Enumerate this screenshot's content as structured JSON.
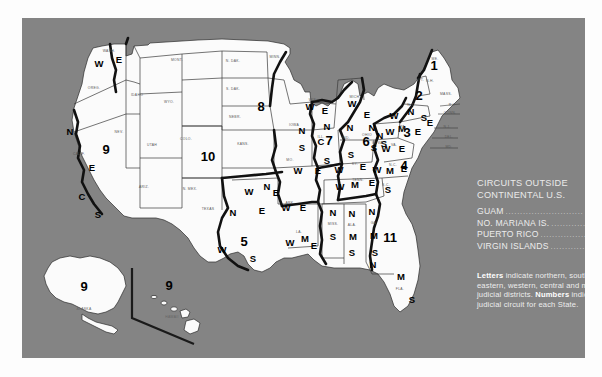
{
  "panel": {
    "background_color": "#848484",
    "land_color": "#fbfbfb",
    "boundary_color": "#111111"
  },
  "legend": {
    "title_line1": "CIRCUITS OUTSIDE",
    "title_line2": "CONTINENTAL U.S.",
    "dots": "...........................",
    "entries": [
      {
        "name": "GUAM",
        "value": "9"
      },
      {
        "name": "NO. MARIANA IS.",
        "value": "9"
      },
      {
        "name": "PUERTO RICO",
        "value": "1"
      },
      {
        "name": "VIRGIN ISLANDS",
        "value": "3"
      }
    ]
  },
  "notes": {
    "letters_label": "Letters",
    "letters_text": " indicate northern, southern, eastern, western, central and middle judicial districts.",
    "numbers_label": "Numbers",
    "numbers_text": " indicate judicial circuit for each State."
  },
  "insets": {
    "alaska": {
      "abbr": "ALASKA",
      "circuit": "9"
    },
    "hawaii": {
      "abbr": "HAWAII",
      "circuit": "9"
    }
  },
  "circuit_numbers": [
    {
      "id": "c1",
      "label": "1",
      "x": 412,
      "y": 52
    },
    {
      "id": "c2",
      "label": "2",
      "x": 397,
      "y": 82
    },
    {
      "id": "c3",
      "label": "3",
      "x": 385,
      "y": 119
    },
    {
      "id": "c4",
      "label": "4",
      "x": 382,
      "y": 152
    },
    {
      "id": "c5",
      "label": "5",
      "x": 222,
      "y": 228
    },
    {
      "id": "c6",
      "label": "6",
      "x": 344,
      "y": 128
    },
    {
      "id": "c7",
      "label": "7",
      "x": 307,
      "y": 127
    },
    {
      "id": "c8",
      "label": "8",
      "x": 239,
      "y": 93
    },
    {
      "id": "c9",
      "label": "9",
      "x": 84,
      "y": 136
    },
    {
      "id": "c10",
      "label": "10",
      "x": 186,
      "y": 143
    },
    {
      "id": "c11",
      "label": "11",
      "x": 368,
      "y": 224
    }
  ],
  "district_letters": [
    {
      "state": "washington",
      "label": "W",
      "x": 77,
      "y": 49
    },
    {
      "state": "washington",
      "label": "E",
      "x": 97,
      "y": 45
    },
    {
      "state": "california",
      "label": "N",
      "x": 48,
      "y": 117
    },
    {
      "state": "california",
      "label": "E",
      "x": 70,
      "y": 153
    },
    {
      "state": "california",
      "label": "C",
      "x": 60,
      "y": 182
    },
    {
      "state": "california",
      "label": "S",
      "x": 76,
      "y": 200
    },
    {
      "state": "texas",
      "label": "N",
      "x": 211,
      "y": 198
    },
    {
      "state": "texas",
      "label": "W",
      "x": 200,
      "y": 235
    },
    {
      "state": "texas",
      "label": "E",
      "x": 240,
      "y": 196
    },
    {
      "state": "texas",
      "label": "S",
      "x": 231,
      "y": 244
    },
    {
      "state": "oklahoma",
      "label": "W",
      "x": 227,
      "y": 177
    },
    {
      "state": "oklahoma",
      "label": "N",
      "x": 245,
      "y": 172
    },
    {
      "state": "oklahoma",
      "label": "E",
      "x": 254,
      "y": 178
    },
    {
      "state": "arkansas",
      "label": "W",
      "x": 264,
      "y": 193
    },
    {
      "state": "arkansas",
      "label": "E",
      "x": 281,
      "y": 193
    },
    {
      "state": "louisiana",
      "label": "W",
      "x": 268,
      "y": 228
    },
    {
      "state": "louisiana",
      "label": "M",
      "x": 283,
      "y": 224
    },
    {
      "state": "louisiana",
      "label": "E",
      "x": 292,
      "y": 231
    },
    {
      "state": "missouri",
      "label": "W",
      "x": 276,
      "y": 156
    },
    {
      "state": "missouri",
      "label": "E",
      "x": 296,
      "y": 156
    },
    {
      "state": "iowa",
      "label": "N",
      "x": 280,
      "y": 116
    },
    {
      "state": "iowa",
      "label": "S",
      "x": 280,
      "y": 133
    },
    {
      "state": "wisconsin",
      "label": "W",
      "x": 288,
      "y": 92
    },
    {
      "state": "wisconsin",
      "label": "E",
      "x": 303,
      "y": 96
    },
    {
      "state": "illinois",
      "label": "N",
      "x": 305,
      "y": 112
    },
    {
      "state": "illinois",
      "label": "C",
      "x": 299,
      "y": 127
    },
    {
      "state": "illinois",
      "label": "S",
      "x": 305,
      "y": 146
    },
    {
      "state": "michigan",
      "label": "W",
      "x": 330,
      "y": 89
    },
    {
      "state": "michigan",
      "label": "E",
      "x": 345,
      "y": 100
    },
    {
      "state": "indiana",
      "label": "N",
      "x": 328,
      "y": 113
    },
    {
      "state": "indiana",
      "label": "S",
      "x": 329,
      "y": 140
    },
    {
      "state": "ohio",
      "label": "N",
      "x": 350,
      "y": 113
    },
    {
      "state": "ohio",
      "label": "S",
      "x": 352,
      "y": 133
    },
    {
      "state": "kentucky",
      "label": "W",
      "x": 317,
      "y": 155
    },
    {
      "state": "kentucky",
      "label": "E",
      "x": 341,
      "y": 152
    },
    {
      "state": "tennessee",
      "label": "W",
      "x": 318,
      "y": 172
    },
    {
      "state": "tennessee",
      "label": "M",
      "x": 333,
      "y": 170
    },
    {
      "state": "tennessee",
      "label": "E",
      "x": 350,
      "y": 168
    },
    {
      "state": "mississippi",
      "label": "N",
      "x": 311,
      "y": 198
    },
    {
      "state": "mississippi",
      "label": "S",
      "x": 311,
      "y": 222
    },
    {
      "state": "alabama",
      "label": "N",
      "x": 330,
      "y": 199
    },
    {
      "state": "alabama",
      "label": "M",
      "x": 331,
      "y": 222
    },
    {
      "state": "alabama",
      "label": "S",
      "x": 330,
      "y": 238
    },
    {
      "state": "georgia",
      "label": "N",
      "x": 350,
      "y": 197
    },
    {
      "state": "georgia",
      "label": "M",
      "x": 352,
      "y": 221
    },
    {
      "state": "georgia",
      "label": "S",
      "x": 353,
      "y": 238
    },
    {
      "state": "florida",
      "label": "N",
      "x": 351,
      "y": 250
    },
    {
      "state": "florida",
      "label": "M",
      "x": 379,
      "y": 262
    },
    {
      "state": "florida",
      "label": "S",
      "x": 390,
      "y": 285
    },
    {
      "state": "north-carolina",
      "label": "W",
      "x": 355,
      "y": 155
    },
    {
      "state": "north-carolina",
      "label": "M",
      "x": 368,
      "y": 156
    },
    {
      "state": "north-carolina",
      "label": "E",
      "x": 382,
      "y": 154
    },
    {
      "state": "south-carolina",
      "label": "S",
      "x": 366,
      "y": 175
    },
    {
      "state": "virginia",
      "label": "W",
      "x": 364,
      "y": 134
    },
    {
      "state": "virginia",
      "label": "E",
      "x": 380,
      "y": 134
    },
    {
      "state": "west-virginia",
      "label": "N",
      "x": 358,
      "y": 121
    },
    {
      "state": "west-virginia",
      "label": "S",
      "x": 362,
      "y": 129
    },
    {
      "state": "new-york",
      "label": "W",
      "x": 372,
      "y": 101
    },
    {
      "state": "new-york",
      "label": "N",
      "x": 389,
      "y": 97
    },
    {
      "state": "new-york",
      "label": "S",
      "x": 402,
      "y": 103
    },
    {
      "state": "new-york",
      "label": "E",
      "x": 408,
      "y": 108
    },
    {
      "state": "pennsylvania",
      "label": "W",
      "x": 368,
      "y": 117
    },
    {
      "state": "pennsylvania",
      "label": "M",
      "x": 380,
      "y": 114
    },
    {
      "state": "pennsylvania",
      "label": "E",
      "x": 396,
      "y": 117
    }
  ],
  "state_abbrs": [
    {
      "label": "WASH.",
      "x": 87,
      "y": 34
    },
    {
      "label": "OREG.",
      "x": 72,
      "y": 71
    },
    {
      "label": "IDAHO",
      "x": 115,
      "y": 78
    },
    {
      "label": "MONT.",
      "x": 155,
      "y": 43
    },
    {
      "label": "N. DAK.",
      "x": 211,
      "y": 44
    },
    {
      "label": "S. DAK.",
      "x": 211,
      "y": 72
    },
    {
      "label": "NEBR.",
      "x": 213,
      "y": 100
    },
    {
      "label": "MINN.",
      "x": 253,
      "y": 40
    },
    {
      "label": "WYO.",
      "x": 147,
      "y": 85
    },
    {
      "label": "COLO.",
      "x": 164,
      "y": 122
    },
    {
      "label": "KANS.",
      "x": 221,
      "y": 127
    },
    {
      "label": "NEV.",
      "x": 97,
      "y": 115
    },
    {
      "label": "UTAH",
      "x": 130,
      "y": 128
    },
    {
      "label": "CALIF.",
      "x": 57,
      "y": 137
    },
    {
      "label": "ARIZ.",
      "x": 122,
      "y": 170
    },
    {
      "label": "N. MEX.",
      "x": 168,
      "y": 172
    },
    {
      "label": "TEXAS",
      "x": 186,
      "y": 192
    },
    {
      "label": "IOWA",
      "x": 272,
      "y": 108
    },
    {
      "label": "MO.",
      "x": 268,
      "y": 143
    },
    {
      "label": "ARK.",
      "x": 268,
      "y": 186
    },
    {
      "label": "LA.",
      "x": 277,
      "y": 215
    },
    {
      "label": "WIS.",
      "x": 291,
      "y": 83
    },
    {
      "label": "ILL.",
      "x": 299,
      "y": 120
    },
    {
      "label": "IND.",
      "x": 324,
      "y": 121
    },
    {
      "label": "MICH.",
      "x": 333,
      "y": 80
    },
    {
      "label": "OHIO",
      "x": 345,
      "y": 118
    },
    {
      "label": "KY.",
      "x": 333,
      "y": 147
    },
    {
      "label": "TENN.",
      "x": 336,
      "y": 163
    },
    {
      "label": "MISS.",
      "x": 311,
      "y": 207
    },
    {
      "label": "ALA.",
      "x": 330,
      "y": 208
    },
    {
      "label": "GA.",
      "x": 352,
      "y": 206
    },
    {
      "label": "FLA.",
      "x": 378,
      "y": 272
    },
    {
      "label": "S.C.",
      "x": 364,
      "y": 168
    },
    {
      "label": "N.C.",
      "x": 371,
      "y": 148
    },
    {
      "label": "VA.",
      "x": 372,
      "y": 128
    },
    {
      "label": "W. VA.",
      "x": 356,
      "y": 126
    },
    {
      "label": "PA.",
      "x": 381,
      "y": 110
    },
    {
      "label": "N.Y.",
      "x": 389,
      "y": 88
    },
    {
      "label": "ME.",
      "x": 413,
      "y": 42
    },
    {
      "label": "VT.",
      "x": 399,
      "y": 63
    },
    {
      "label": "N.H.",
      "x": 408,
      "y": 64
    },
    {
      "label": "MASS.",
      "x": 424,
      "y": 77
    },
    {
      "label": "R.I.",
      "x": 430,
      "y": 88
    },
    {
      "label": "CONN.",
      "x": 428,
      "y": 96
    },
    {
      "label": "N.J.",
      "x": 425,
      "y": 110
    },
    {
      "label": "DEL.",
      "x": 427,
      "y": 120
    },
    {
      "label": "MD.",
      "x": 427,
      "y": 130
    }
  ]
}
